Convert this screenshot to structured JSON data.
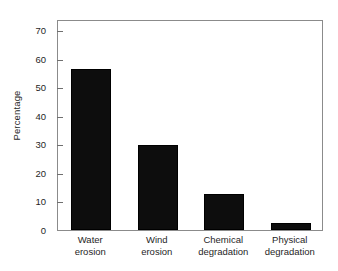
{
  "chart_data": {
    "type": "bar",
    "title": "",
    "xlabel": "",
    "ylabel": "Percentage",
    "categories": [
      "Water erosion",
      "Wind erosion",
      "Chemical degradation",
      "Physical degradation"
    ],
    "category_lines": [
      [
        "Water",
        "erosion"
      ],
      [
        "Wind",
        "erosion"
      ],
      [
        "Chemical",
        "degradation"
      ],
      [
        "Physical",
        "degradation"
      ]
    ],
    "values": [
      56.5,
      29.8,
      12.5,
      2.5
    ],
    "ylim": [
      0,
      74
    ],
    "yticks": [
      0,
      10,
      20,
      30,
      40,
      50,
      60,
      70
    ],
    "ytick_labels": [
      "0",
      "10",
      "20",
      "30",
      "40",
      "50",
      "60",
      "70"
    ],
    "grid": false,
    "legend": null,
    "bar_color": "#0d0d0d",
    "frame_color": "#8b8b8b",
    "background": "#ffffff"
  }
}
